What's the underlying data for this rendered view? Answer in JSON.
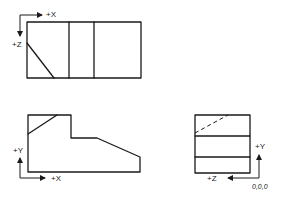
{
  "diagram": {
    "type": "orthographic-projection",
    "views": {
      "top": {
        "axis_labels": {
          "horizontal": "+X",
          "vertical": "+Z"
        }
      },
      "front": {
        "axis_labels": {
          "vertical": "+Y",
          "horizontal": "+X"
        }
      },
      "side": {
        "axis_labels": {
          "vertical": "+Y",
          "horizontal": "+Z"
        },
        "origin_label": "0,0,0"
      }
    },
    "colors": {
      "ink": "#1a1a1a",
      "background": "#ffffff"
    }
  }
}
